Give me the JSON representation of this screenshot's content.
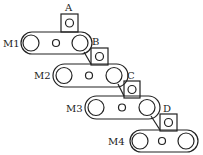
{
  "diagram": {
    "stroke_color": "#222222",
    "background": "#ffffff",
    "machines": [
      {
        "label": "M1",
        "box_label": "A"
      },
      {
        "label": "M2",
        "box_label": "B"
      },
      {
        "label": "M3",
        "box_label": "C"
      },
      {
        "label": "M4",
        "box_label": "D"
      }
    ]
  }
}
